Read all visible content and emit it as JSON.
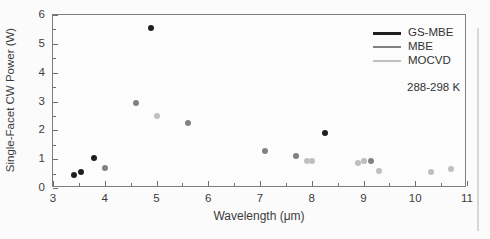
{
  "figure": {
    "background": "#fbfbfb",
    "frame_color": "#7e7e7e",
    "text_color": "#3b3b3b"
  },
  "chart_data": {
    "type": "scatter",
    "title": "",
    "xlabel": "Wavelength (μm)",
    "ylabel": "Single-Facet CW Power (W)",
    "xlim": [
      3,
      11
    ],
    "ylim": [
      0,
      6
    ],
    "x_major_ticks": [
      3,
      4,
      5,
      6,
      7,
      8,
      9,
      10,
      11
    ],
    "x_minor_ticks": [
      3.5,
      4.5,
      5.5,
      6.5,
      7.5,
      8.5,
      9.5,
      10.5
    ],
    "y_major_ticks": [
      0,
      1,
      2,
      3,
      4,
      5,
      6
    ],
    "y_minor_ticks": [
      0.5,
      1.5,
      2.5,
      3.5,
      4.5,
      5.5
    ],
    "grid": false,
    "legend_position": "top-right",
    "annotation": "288-298 K",
    "series": [
      {
        "name": "GS-MBE",
        "color": "#1f1f1f",
        "points": [
          [
            3.4,
            0.45
          ],
          [
            3.55,
            0.55
          ],
          [
            3.8,
            1.05
          ],
          [
            4.9,
            5.55
          ],
          [
            8.25,
            1.9
          ]
        ]
      },
      {
        "name": "MBE",
        "color": "#818181",
        "points": [
          [
            4.0,
            0.7
          ],
          [
            4.6,
            2.95
          ],
          [
            5.6,
            2.25
          ],
          [
            7.1,
            1.3
          ],
          [
            7.7,
            1.1
          ],
          [
            9.15,
            0.95
          ]
        ]
      },
      {
        "name": "MOCVD",
        "color": "#bfbfbf",
        "points": [
          [
            5.0,
            2.5
          ],
          [
            7.9,
            0.95
          ],
          [
            8.0,
            0.95
          ],
          [
            8.9,
            0.85
          ],
          [
            9.0,
            0.95
          ],
          [
            9.3,
            0.6
          ],
          [
            10.3,
            0.55
          ],
          [
            10.7,
            0.65
          ]
        ]
      }
    ]
  }
}
